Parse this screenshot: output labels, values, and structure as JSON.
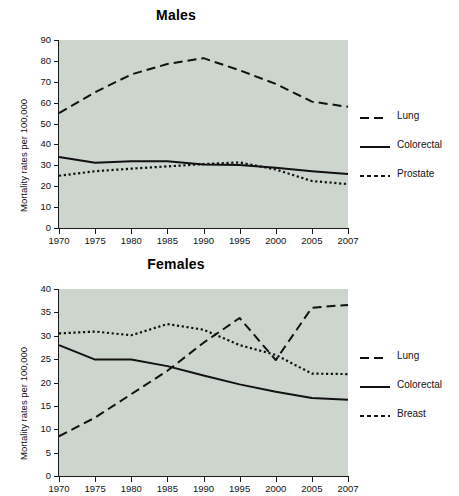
{
  "figure": {
    "background": "#ffffff",
    "plot_background": "#ccd6cd",
    "line_color": "#111111"
  },
  "panels": [
    {
      "key": "males",
      "title": "Males",
      "ylabel": "Mortality rates per 100,000",
      "legend": [
        {
          "label": "Lung",
          "style": "dashed"
        },
        {
          "label": "Colorectal",
          "style": "solid"
        },
        {
          "label": "Prostate",
          "style": "dotted"
        }
      ],
      "yticks": [
        "0",
        "10",
        "20",
        "30",
        "40",
        "50",
        "60",
        "70",
        "80",
        "90"
      ],
      "xticks": [
        "1970",
        "1975",
        "1980",
        "1985",
        "1990",
        "1995",
        "2000",
        "2005",
        "2007"
      ]
    },
    {
      "key": "females",
      "title": "Females",
      "ylabel": "Mortality rates per 100,000",
      "legend": [
        {
          "label": "Lung",
          "style": "dashed"
        },
        {
          "label": "Colorectal",
          "style": "solid"
        },
        {
          "label": "Breast",
          "style": "dotted"
        }
      ],
      "yticks": [
        "0",
        "5",
        "10",
        "15",
        "20",
        "25",
        "30",
        "35",
        "40"
      ],
      "xticks": [
        "1970",
        "1975",
        "1980",
        "1985",
        "1990",
        "1995",
        "2000",
        "2005",
        "2007"
      ]
    }
  ],
  "chart_data": [
    {
      "type": "line",
      "title": "Males",
      "xlabel": "",
      "ylabel": "Mortality rates per 100,000",
      "x": [
        1970,
        1975,
        1980,
        1985,
        1990,
        1995,
        2000,
        2005,
        2007
      ],
      "xlim": [
        1970,
        2007
      ],
      "ylim": [
        0,
        90
      ],
      "ytick_step": 10,
      "grid": false,
      "legend_position": "right",
      "series": [
        {
          "name": "Lung",
          "style": "dashed",
          "values": [
            55.0,
            65.0,
            73.5,
            78.5,
            81.3,
            75.5,
            69.0,
            60.5,
            58.0
          ]
        },
        {
          "name": "Colorectal",
          "style": "solid",
          "values": [
            34.0,
            31.2,
            32.0,
            32.0,
            30.4,
            30.2,
            28.8,
            27.2,
            25.8
          ]
        },
        {
          "name": "Prostate",
          "style": "dotted",
          "values": [
            25.0,
            27.2,
            28.4,
            29.5,
            30.6,
            31.4,
            28.0,
            22.5,
            21.0
          ]
        }
      ]
    },
    {
      "type": "line",
      "title": "Females",
      "xlabel": "",
      "ylabel": "Mortality rates per 100,000",
      "x": [
        1970,
        1975,
        1980,
        1985,
        1990,
        1995,
        2000,
        2005,
        2007
      ],
      "xlim": [
        1970,
        2007
      ],
      "ylim": [
        0,
        40
      ],
      "ytick_step": 5,
      "grid": false,
      "legend_position": "right",
      "series": [
        {
          "name": "Lung",
          "style": "dashed",
          "values": [
            8.5,
            12.5,
            17.5,
            22.5,
            28.5,
            33.8,
            24.8,
            36.0,
            36.6
          ]
        },
        {
          "name": "Colorectal",
          "style": "solid",
          "values": [
            28.0,
            24.9,
            24.9,
            23.5,
            21.5,
            19.6,
            18.0,
            16.7,
            16.3
          ]
        },
        {
          "name": "Breast",
          "style": "dotted",
          "values": [
            30.5,
            30.9,
            30.1,
            32.5,
            31.3,
            28.0,
            25.9,
            21.9,
            21.8
          ]
        }
      ]
    }
  ]
}
